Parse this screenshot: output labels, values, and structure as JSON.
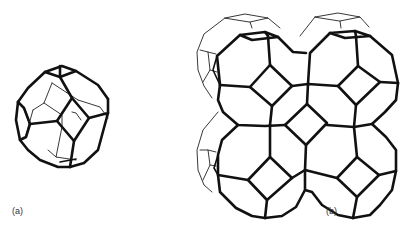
{
  "figure": {
    "panels": [
      {
        "id": "a",
        "label": "(a)",
        "description": "single sodalite cage (truncated octahedron)"
      },
      {
        "id": "b",
        "label": "(b)",
        "description": "sodalite cages joined via square faces forming a framework"
      }
    ]
  },
  "colors": {
    "line": "#111111",
    "background": "#ffffff",
    "label": "#333333"
  }
}
